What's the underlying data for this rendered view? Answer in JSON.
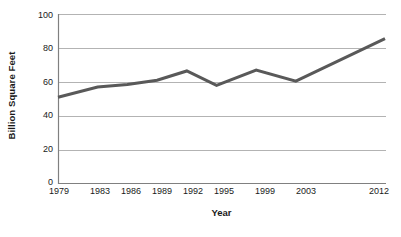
{
  "chart_data": {
    "type": "line",
    "title": "",
    "xlabel": "Year",
    "ylabel": "Billion Square Feet",
    "categories": [
      "1979",
      "1983",
      "1986",
      "1989",
      "1992",
      "1995",
      "1999",
      "2003",
      "2012"
    ],
    "x": [
      1979,
      1983,
      1986,
      1989,
      1992,
      1995,
      1999,
      2003,
      2012
    ],
    "values": [
      51,
      57,
      58.5,
      61,
      66.5,
      58,
      67,
      60.5,
      85.5
    ],
    "series": [
      {
        "name": "Billion Square Feet",
        "values": [
          51,
          57,
          58.5,
          61,
          66.5,
          58,
          67,
          60.5,
          85.5
        ]
      }
    ],
    "ylim": [
      0,
      100
    ],
    "xlim": [
      1979,
      2012
    ],
    "yticks": [
      0,
      20,
      40,
      60,
      80,
      100
    ],
    "ytick_labels": [
      "0",
      "20",
      "40",
      "60",
      "80",
      "100"
    ],
    "xtick_labels": [
      "1979",
      "1983",
      "1986",
      "1989",
      "1992",
      "1995",
      "1999",
      "2003",
      "2012"
    ],
    "grid": "horizontal",
    "legend": "none",
    "line_color": "#595959",
    "grid_color": "#b3b3b3",
    "axis_color": "#808080",
    "text_color": "#1a1a1a",
    "background": "#ffffff",
    "line_width": 3
  }
}
